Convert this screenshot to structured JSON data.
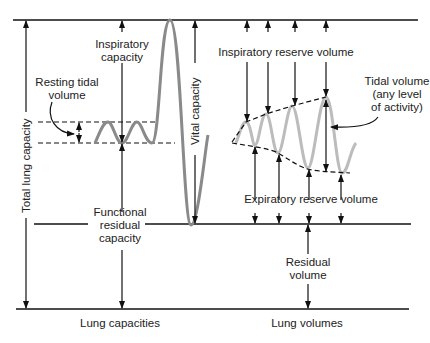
{
  "diagram": {
    "colors": {
      "line": "#111111",
      "resting_wave": "#8a8a8a",
      "activity_wave": "#bcbcbc",
      "text": "#222222"
    },
    "left_section": {
      "footer": "Lung capacities",
      "labels": {
        "total_lung_capacity": "Total lung capacity",
        "inspiratory_capacity_1": "Inspiratory",
        "inspiratory_capacity_2": "capacity",
        "resting_tidal_volume_1": "Resting tidal",
        "resting_tidal_volume_2": "volume",
        "vital_capacity": "Vital capacity",
        "functional_residual_capacity_1": "Functional",
        "functional_residual_capacity_2": "residual",
        "functional_residual_capacity_3": "capacity"
      }
    },
    "right_section": {
      "footer": "Lung volumes",
      "labels": {
        "inspiratory_reserve_volume": "Inspiratory reserve volume",
        "tidal_volume_1": "Tidal volume",
        "tidal_volume_2": "(any level",
        "tidal_volume_3": "of activity)",
        "expiratory_reserve_volume": "Expiratory reserve volume",
        "residual_volume_1": "Residual",
        "residual_volume_2": "volume"
      }
    }
  }
}
